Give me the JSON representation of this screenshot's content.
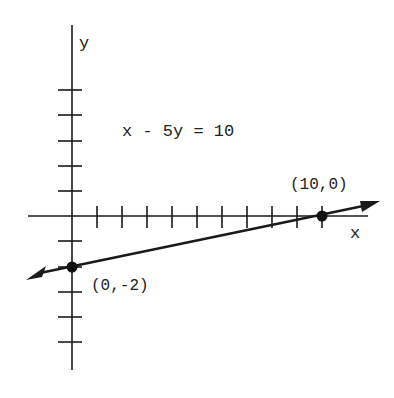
{
  "graph": {
    "equation": "x - 5y = 10",
    "x_axis_label": "x",
    "y_axis_label": "y",
    "points": [
      {
        "label": "(10,0)",
        "x": 10,
        "y": 0
      },
      {
        "label": "(0,-2)",
        "x": 0,
        "y": -2
      }
    ],
    "x_ticks": [
      1,
      2,
      3,
      4,
      5,
      6,
      7,
      8,
      9,
      10
    ],
    "y_ticks": [
      -5,
      -4,
      -3,
      -2,
      -1,
      1,
      2,
      3,
      4,
      5
    ],
    "line_color": "#1a1a1a"
  }
}
